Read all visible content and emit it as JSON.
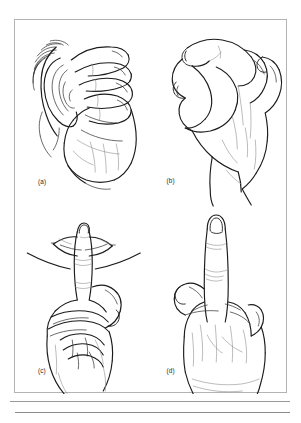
{
  "figure": {
    "kind": "line-drawing-plate",
    "panel_count": 4,
    "background_color": "#ffffff",
    "ink_color": "#1b1b1b",
    "frame_color": "#b3b3b3",
    "rule_color": "#9a9a9a",
    "panels": [
      {
        "id": "a",
        "label": "(a)",
        "icon": "hand-cupped-behind-ear-icon",
        "description": "Open hand cupped behind an ear"
      },
      {
        "id": "b",
        "label": "(b)",
        "icon": "hand-ok-sign-icon",
        "description": "Thumb and index finger touching to form a ring, other fingers curled"
      },
      {
        "id": "c",
        "label": "(c)",
        "icon": "hand-index-finger-to-lips-icon",
        "description": "Index finger raised vertically against the lips, other fingers folded"
      },
      {
        "id": "d",
        "label": "(d)",
        "icon": "hand-middle-finger-raised-icon",
        "description": "Fist with the middle finger extended upward"
      }
    ]
  }
}
